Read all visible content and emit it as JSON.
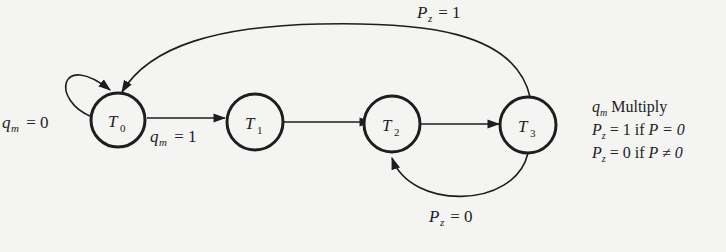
{
  "diagram": {
    "type": "state-diagram",
    "nodes": [
      {
        "id": "T0",
        "label": "T",
        "sub": "0"
      },
      {
        "id": "T1",
        "label": "T",
        "sub": "1"
      },
      {
        "id": "T2",
        "label": "T",
        "sub": "2"
      },
      {
        "id": "T3",
        "label": "T",
        "sub": "3"
      }
    ],
    "edges": [
      {
        "from": "T0",
        "to": "T0",
        "label_var": "q",
        "label_sub": "m",
        "label_rest": " = 0"
      },
      {
        "from": "T0",
        "to": "T1",
        "label_var": "q",
        "label_sub": "m",
        "label_rest": " = 1"
      },
      {
        "from": "T1",
        "to": "T2",
        "label_var": "",
        "label_sub": "",
        "label_rest": ""
      },
      {
        "from": "T2",
        "to": "T3",
        "label_var": "",
        "label_sub": "",
        "label_rest": ""
      },
      {
        "from": "T3",
        "to": "T0",
        "label_var": "P",
        "label_sub": "z",
        "label_rest": " = 1"
      },
      {
        "from": "T3",
        "to": "T2",
        "label_var": "P",
        "label_sub": "z",
        "label_rest": " = 0"
      }
    ],
    "legend": [
      {
        "var": "q",
        "sub": "m",
        "text": " Multiply"
      },
      {
        "var": "P",
        "sub": "z",
        "text": " = 1 if ",
        "cond": "P = 0"
      },
      {
        "var": "P",
        "sub": "z",
        "text": " = 0 if ",
        "cond": "P ≠ 0"
      }
    ]
  }
}
